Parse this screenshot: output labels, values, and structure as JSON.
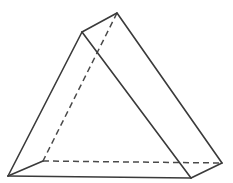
{
  "figure": {
    "name": "triangular-prism",
    "background_color": "#ffffff",
    "stroke_color": "#3a3a3a",
    "hidden_stroke_color": "#4a4a4a",
    "face_color": "#ffffff",
    "stroke_width": 1.6,
    "hidden_stroke_width": 1.5,
    "hidden_dash_pattern": "6 4",
    "canvas": {
      "width": 233,
      "height": 183
    }
  },
  "vertices": {
    "apex_top": {
      "label": "A",
      "x": 117,
      "y": 13
    },
    "apex_left": {
      "label": "B",
      "x": 82,
      "y": 32
    },
    "base_front_left": {
      "label": "C",
      "x": 8,
      "y": 176
    },
    "base_front_right": {
      "label": "D",
      "x": 191,
      "y": 178
    },
    "base_back_right": {
      "label": "E",
      "x": 222,
      "y": 163
    },
    "base_back_left": {
      "label": "F",
      "x": 43,
      "y": 161
    }
  },
  "edges": {
    "visible": [
      {
        "name": "top-ridge",
        "from": "apex_left",
        "to": "apex_top",
        "points": "82,32 117,13"
      },
      {
        "name": "front-left-slant",
        "from": "apex_left",
        "to": "base_front_left",
        "points": "82,32 8,176"
      },
      {
        "name": "front-right-slant",
        "from": "apex_left",
        "to": "base_front_right",
        "points": "82,32 191,178"
      },
      {
        "name": "back-right-slant",
        "from": "apex_top",
        "to": "base_back_right",
        "points": "117,13 222,163"
      },
      {
        "name": "base-front-edge",
        "from": "base_front_left",
        "to": "base_front_right",
        "points": "8,176 191,178"
      },
      {
        "name": "base-right-edge",
        "from": "base_front_right",
        "to": "base_back_right",
        "points": "191,178 222,163"
      },
      {
        "name": "base-left-edge",
        "from": "base_front_left",
        "to": "base_back_left",
        "points": "8,176 43,161"
      }
    ],
    "hidden": [
      {
        "name": "hidden-vertical-slant",
        "from": "apex_top",
        "to": "base_back_left",
        "points": "117,13 43,161"
      },
      {
        "name": "hidden-base-back-edge",
        "from": "base_back_left",
        "to": "base_back_right",
        "points": "43,161 222,163"
      }
    ]
  },
  "faces": [
    {
      "name": "front-face",
      "points": "82,32 191,178 8,176"
    },
    {
      "name": "right-face",
      "points": "82,32 117,13 222,163 191,178"
    }
  ]
}
